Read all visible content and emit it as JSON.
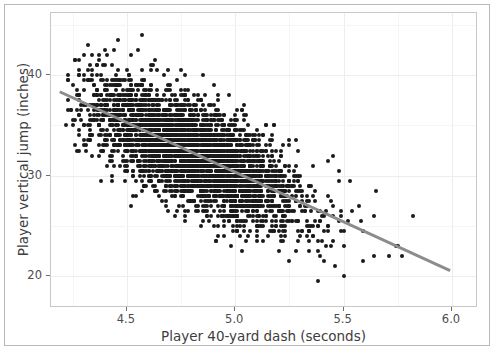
{
  "chart_data": {
    "type": "scatter",
    "title": "",
    "xlabel": "Player 40-yard dash (seconds)",
    "ylabel": "Player vertical jump (inches)",
    "xlim": [
      4.15,
      6.12
    ],
    "ylim": [
      16.8,
      46.2
    ],
    "xticks": [
      4.5,
      5.0,
      5.5,
      6.0
    ],
    "xticklabels": [
      "4.5",
      "5.0",
      "5.5",
      "6.0"
    ],
    "yticks": [
      20,
      30,
      40
    ],
    "yticklabels": [
      "20",
      "30",
      "40"
    ],
    "grid": true,
    "legend": null,
    "n_points": 3400,
    "point_color": "#1a1a1a",
    "point_size_px": 4,
    "panel_background": "#ffffff",
    "gridline_color": "#ededed",
    "frame_color": "#c8c8c8",
    "distribution": {
      "x_mean": 4.78,
      "x_sd": 0.24,
      "x_min": 4.22,
      "x_max": 6.0,
      "y_given_x_intercept": 79.5,
      "y_given_x_slope": -9.85,
      "residual_sd": 2.55,
      "y_min": 17.4,
      "y_max": 45.6
    },
    "trendline": {
      "type": "linear-fit",
      "color": "#8c8c8c",
      "width_px": 3,
      "x_start": 4.19,
      "y_start": 38.3,
      "x_end": 6.0,
      "y_end": 20.35,
      "slope": -9.92,
      "intercept": 79.86
    },
    "annotations": []
  },
  "axes": {
    "x_title": "Player 40-yard dash (seconds)",
    "y_title": "Player vertical jump (inches)",
    "x_tick_labels": [
      "4.5",
      "5.0",
      "5.5",
      "6.0"
    ],
    "y_tick_labels": [
      "40",
      "30",
      "20"
    ]
  }
}
